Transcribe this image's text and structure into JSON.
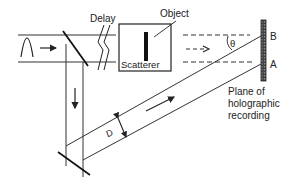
{
  "diagram": {
    "type": "holography-setup",
    "labels": {
      "delay": "Delay",
      "object": "Object",
      "scatterer": "Scatterer",
      "theta": "θ",
      "point_b": "B",
      "point_a": "A",
      "d": "D",
      "plane_line1": "Plane of",
      "plane_line2": "holographic",
      "plane_line3": "recording"
    },
    "components": [
      {
        "id": "input-pulse",
        "desc": "incoming light pulse between two parallel lines"
      },
      {
        "id": "beam-splitter",
        "desc": "diagonal splitter sending part of beam down"
      },
      {
        "id": "delay",
        "desc": "broken-line delay symbol"
      },
      {
        "id": "object-box",
        "desc": "box containing scatterer bar"
      },
      {
        "id": "mirror",
        "desc": "mirror at bottom reflecting reference beam diagonally"
      },
      {
        "id": "recording-plate",
        "desc": "hatched vertical plate with points A and B"
      }
    ],
    "colors": {
      "ink": "#222222",
      "background": "#ffffff"
    }
  }
}
